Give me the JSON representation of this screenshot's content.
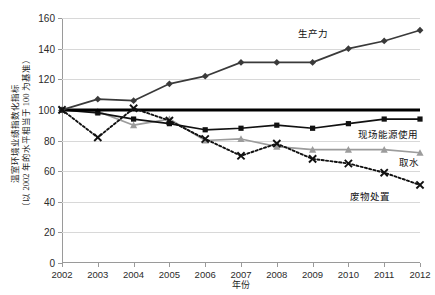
{
  "chart_data": {
    "type": "line",
    "title": "",
    "xlabel": "年份",
    "ylabel_line1": "温室环境业绩指数化指标",
    "ylabel_line2": "（以 2002 年的水平相当于 100 为基准）",
    "x": [
      2002,
      2003,
      2004,
      2005,
      2006,
      2007,
      2008,
      2009,
      2010,
      2011,
      2012
    ],
    "xtick_labels": [
      "2002",
      "2003",
      "2004",
      "2005",
      "2006",
      "2007",
      "2008",
      "2009",
      "2010",
      "2011",
      "2012"
    ],
    "ylim": [
      0,
      160
    ],
    "yticks": [
      0,
      20,
      40,
      60,
      80,
      100,
      120,
      140,
      160
    ],
    "ytick_labels": [
      "0",
      "20",
      "40",
      "60",
      "80",
      "100",
      "120",
      "140",
      "160"
    ],
    "grid": true,
    "legend_position": "inline-annotations",
    "reference_line": {
      "value": 100,
      "color": "#000000",
      "width_px": 3,
      "note": "2002 baseline = 100"
    },
    "series": [
      {
        "name": "生产力",
        "label": "生产力",
        "marker": "diamond",
        "linestyle": "solid",
        "color": "#3a3a3a",
        "values": [
          100,
          107,
          106,
          117,
          122,
          131,
          131,
          131,
          140,
          145,
          152
        ],
        "annotation": {
          "x": 2009.0,
          "y": 150
        }
      },
      {
        "name": "现场能源使用",
        "label": "现场能源使用",
        "marker": "square",
        "linestyle": "solid",
        "color": "#111111",
        "values": [
          100,
          98,
          94,
          91,
          87,
          88,
          90,
          88,
          91,
          94,
          94
        ],
        "annotation": {
          "x": 2011.1,
          "y": 84
        }
      },
      {
        "name": "取水",
        "label": "取水",
        "marker": "triangle",
        "linestyle": "solid",
        "color": "#9c9c9c",
        "values": [
          100,
          99,
          90,
          94,
          80,
          81,
          76,
          74,
          74,
          74,
          72
        ],
        "annotation": {
          "x": 2011.7,
          "y": 66
        }
      },
      {
        "name": "废物处置",
        "label": "废物处置",
        "marker": "x",
        "linestyle": "dotted",
        "color": "#111111",
        "values": [
          100,
          82,
          101,
          93,
          81,
          70,
          78,
          68,
          65,
          59,
          51
        ],
        "annotation": {
          "x": 2010.6,
          "y": 44
        }
      }
    ]
  },
  "axes": {
    "y_title_full": "温室环境业绩指数化指标（以 2002 年的水平相当于 100 为基准）",
    "x_title": "年份"
  }
}
